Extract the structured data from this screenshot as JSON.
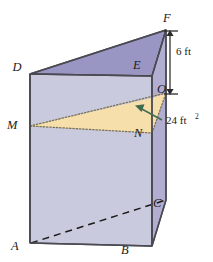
{
  "figure": {
    "name": "triangular-prism-cross-section-diagram",
    "background_color": "#ffffff",
    "colors": {
      "top_face": "#9a96c4",
      "front_face": "#c9cade",
      "right_face": "#b2aed2",
      "cross_section_fill": "#f7dfab",
      "edge": "#4a4a52",
      "dotted_edge": "#6b6b5a",
      "dashed_edge": "#1b1b1b",
      "dimension_arrow": "#5a5a5a",
      "callout_arrow": "#3f6b4f",
      "label_text": "#1b1b1b"
    },
    "vertex_labels": [
      {
        "id": "F",
        "text": "F",
        "x": 163,
        "y": 22
      },
      {
        "id": "D",
        "text": "D",
        "x": 17,
        "y": 71
      },
      {
        "id": "E",
        "text": "E",
        "x": 133,
        "y": 69
      },
      {
        "id": "O",
        "text": "O",
        "x": 157,
        "y": 93
      },
      {
        "id": "M",
        "text": "M",
        "x": 7,
        "y": 129
      },
      {
        "id": "N",
        "text": "N",
        "x": 134,
        "y": 137
      },
      {
        "id": "C",
        "text": "C",
        "x": 153,
        "y": 207
      },
      {
        "id": "A",
        "text": "A",
        "x": 11,
        "y": 250
      },
      {
        "id": "B",
        "text": "B",
        "x": 121,
        "y": 254
      }
    ],
    "annotations": {
      "height_dimension": {
        "label": "6 ft",
        "x": 176,
        "y": 55
      },
      "area_callout": {
        "label": "24 ft",
        "superscript": "2",
        "x": 166,
        "y": 124
      }
    }
  }
}
